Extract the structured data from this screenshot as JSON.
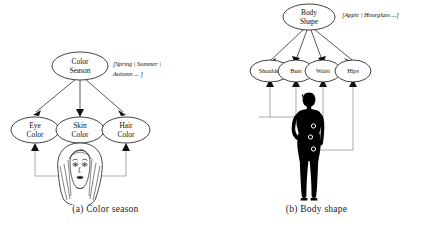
{
  "figure": {
    "panels": [
      {
        "id": "color-season",
        "caption": "(a) Color season",
        "root": {
          "line1": "Color",
          "line2": "Season"
        },
        "annotation_line1": "[Spring | Summer |",
        "annotation_line2": "Autumn ... ]",
        "children": [
          {
            "line1": "Eye",
            "line2": "Color"
          },
          {
            "line1": "Skin",
            "line2": "Color"
          },
          {
            "line1": "Hair",
            "line2": "Color"
          }
        ],
        "source_image": "face-illustration"
      },
      {
        "id": "body-shape",
        "caption": "(b) Body shape",
        "root": {
          "line1": "Body",
          "line2": "Shape"
        },
        "annotation_line1": "[Apple | Hourglass ...]",
        "annotation_line2": "",
        "children": [
          {
            "line1": "Shoulder",
            "line2": ""
          },
          {
            "line1": "Bust",
            "line2": ""
          },
          {
            "line1": "Waist",
            "line2": ""
          },
          {
            "line1": "Hips",
            "line2": ""
          }
        ],
        "source_image": "body-silhouette"
      }
    ]
  },
  "colors": {
    "ink": "#111111",
    "feed_line": "#8d8d8d",
    "background": "#ffffff",
    "silhouette": "#000000"
  }
}
